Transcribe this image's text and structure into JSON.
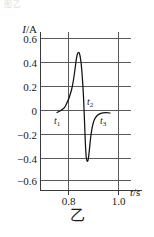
{
  "figure": {
    "caption": "乙",
    "top_artifact_text": "图乙",
    "axis_color": "#4a4a4a",
    "grid_color": "#5a5a5a",
    "curve_color": "#111111",
    "text_color": "#1a1a1a"
  },
  "chart_data": {
    "type": "line",
    "title": "",
    "xlabel": "t/s",
    "ylabel": "I/A",
    "xlim": [
      0.74,
      1.06
    ],
    "ylim": [
      -0.7,
      0.68
    ],
    "grid": true,
    "legend": false,
    "x_ticks": [
      0.8,
      1.0
    ],
    "x_tick_labels": [
      "0.8",
      "1.0"
    ],
    "y_ticks": [
      0.6,
      0.4,
      0.2,
      0,
      -0.2,
      -0.4,
      -0.6
    ],
    "y_tick_labels": [
      "0.6",
      "0.4",
      "0.2",
      "0",
      "−0.2",
      "−0.4",
      "−0.6"
    ],
    "series": [
      {
        "name": "current",
        "x": [
          0.79,
          0.8,
          0.812,
          0.824,
          0.834,
          0.842,
          0.848,
          0.854,
          0.86,
          0.866,
          0.871,
          0.876,
          0.88,
          0.884,
          0.888,
          0.892,
          0.896,
          0.9,
          0.904,
          0.908,
          0.912,
          0.918,
          0.926,
          0.936,
          0.948,
          0.962
        ],
        "y": [
          -0.02,
          0.0,
          0.03,
          0.075,
          0.125,
          0.18,
          0.235,
          0.3,
          0.375,
          0.45,
          0.5,
          0.47,
          0.39,
          0.29,
          0.17,
          0.04,
          -0.11,
          -0.26,
          -0.375,
          -0.42,
          -0.4,
          -0.3,
          -0.175,
          -0.09,
          -0.045,
          -0.03
        ]
      }
    ],
    "annotations": [
      {
        "label": "t₁",
        "x": 0.8,
        "y": 0.0,
        "text": "t",
        "sub": "1"
      },
      {
        "label": "t₂",
        "x": 0.89,
        "y": 0.15,
        "text": "t",
        "sub": "2"
      },
      {
        "label": "t₃",
        "x": 0.93,
        "y": -0.105,
        "text": "t",
        "sub": "3"
      }
    ]
  }
}
